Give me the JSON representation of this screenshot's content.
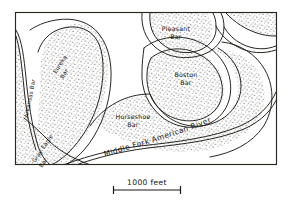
{
  "figure": {
    "kind": "hand-drawn-geologic-map",
    "background_color": "#ffffff",
    "ink_color": "#1c1a16",
    "frame": {
      "x": 15,
      "y": 12,
      "width": 262,
      "height": 153
    }
  },
  "river": {
    "name": "Middle Fork American River",
    "label_color": "#15130f"
  },
  "bars": [
    {
      "id": "arkansas",
      "label_line1": "Arkansas Bar",
      "label_line2": "",
      "rotation": -78,
      "x": 26,
      "y": 95
    },
    {
      "id": "eureka",
      "label_line1": "Eureka",
      "label_line2": "Bar",
      "rotation": -57,
      "x": 62,
      "y": 60
    },
    {
      "id": "gray-eagle",
      "label_line1": "Gray Eagle",
      "label_line2": "Bar",
      "rotation": -58,
      "x": 44,
      "y": 148
    },
    {
      "id": "pleasant",
      "label_line1": "Pleasant",
      "label_line2": "Bar",
      "rotation": 0,
      "x": 175,
      "y": 32
    },
    {
      "id": "boston",
      "label_line1": "Boston",
      "label_line2": "Bar",
      "rotation": 0,
      "x": 186,
      "y": 76
    },
    {
      "id": "horseshoe",
      "label_line1": "Horseshoe",
      "label_line2": "Bar",
      "rotation": 0,
      "x": 132,
      "y": 118
    }
  ],
  "scale_bar": {
    "label": "1000 feet",
    "x_start": 113,
    "x_end": 181,
    "y": 190,
    "label_x": 147,
    "label_y": 184
  },
  "legend_note": {
    "stipple_means": "gravel bar deposits"
  }
}
